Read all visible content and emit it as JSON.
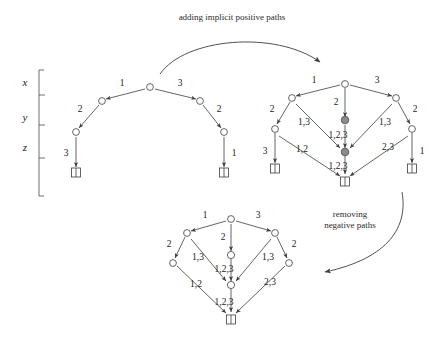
{
  "figure": {
    "title_visible": false,
    "width": 429,
    "height": 346,
    "background": "#ffffff",
    "ink_color": "#3d3d3d",
    "filled_node_color": "#8c8c8c",
    "open_node_color": "#ffffff"
  },
  "captions": {
    "top": "adding implicit positive paths",
    "right_line1": "removing",
    "right_line2": "negative paths"
  },
  "axis": {
    "labels": [
      "x",
      "y",
      "z"
    ],
    "bracket_note": "vertical level bracket with three level labels"
  },
  "diagrams": [
    {
      "id": "left",
      "name": "original-graph",
      "description": "initial partial order diagram with explicit edges only",
      "nodes": [
        {
          "id": "top",
          "kind": "open"
        },
        {
          "id": "upper-left",
          "kind": "open"
        },
        {
          "id": "upper-right",
          "kind": "open"
        },
        {
          "id": "mid-left",
          "kind": "open"
        },
        {
          "id": "mid-right",
          "kind": "open"
        },
        {
          "id": "bottom-left-terminal",
          "kind": "terminal"
        },
        {
          "id": "bottom-right-terminal",
          "kind": "terminal"
        }
      ],
      "edge_labels": [
        {
          "id": "l-top-left",
          "text": "1"
        },
        {
          "id": "l-top-right",
          "text": "3"
        },
        {
          "id": "l-left-down",
          "text": "2"
        },
        {
          "id": "l-right-down",
          "text": "2"
        },
        {
          "id": "l-left-bottom",
          "text": "3"
        },
        {
          "id": "l-right-bottom",
          "text": "1"
        }
      ]
    },
    {
      "id": "right",
      "name": "graph-with-implicit-positive-paths",
      "description": "same graph after adding implicit positive paths; central chain nodes are filled",
      "nodes": [
        {
          "id": "top",
          "kind": "open"
        },
        {
          "id": "upper-left",
          "kind": "open"
        },
        {
          "id": "upper-right",
          "kind": "open"
        },
        {
          "id": "mid-left",
          "kind": "open"
        },
        {
          "id": "mid-right",
          "kind": "open"
        },
        {
          "id": "center-upper",
          "kind": "filled"
        },
        {
          "id": "center-lower",
          "kind": "filled"
        },
        {
          "id": "bottom-left-terminal",
          "kind": "terminal"
        },
        {
          "id": "bottom-right-terminal",
          "kind": "terminal"
        },
        {
          "id": "bottom-center-terminal",
          "kind": "terminal"
        }
      ],
      "edge_labels": [
        {
          "id": "r-top-left",
          "text": "1"
        },
        {
          "id": "r-top-right",
          "text": "3"
        },
        {
          "id": "r-top-center",
          "text": "2"
        },
        {
          "id": "r-left-down",
          "text": "2"
        },
        {
          "id": "r-right-down",
          "text": "2"
        },
        {
          "id": "r-left-diag",
          "text": "1,3"
        },
        {
          "id": "r-right-diag",
          "text": "1,3"
        },
        {
          "id": "r-center-mid",
          "text": "1,2,3"
        },
        {
          "id": "r-left-low-diag",
          "text": "1,2"
        },
        {
          "id": "r-right-low-diag",
          "text": "2,3"
        },
        {
          "id": "r-center-bottom",
          "text": "1,2,3"
        },
        {
          "id": "r-left-bottom",
          "text": "3"
        },
        {
          "id": "r-right-bottom",
          "text": "1"
        }
      ]
    },
    {
      "id": "bottom",
      "name": "graph-after-removing-negative-paths",
      "description": "final graph after removing negative paths; central chain nodes are open and side terminals are gone",
      "nodes": [
        {
          "id": "top",
          "kind": "open"
        },
        {
          "id": "upper-left",
          "kind": "open"
        },
        {
          "id": "upper-right",
          "kind": "open"
        },
        {
          "id": "mid-left",
          "kind": "open"
        },
        {
          "id": "mid-right",
          "kind": "open"
        },
        {
          "id": "center-upper",
          "kind": "open"
        },
        {
          "id": "center-lower",
          "kind": "open"
        },
        {
          "id": "bottom-center-terminal",
          "kind": "terminal"
        }
      ],
      "edge_labels": [
        {
          "id": "b-top-left",
          "text": "1"
        },
        {
          "id": "b-top-right",
          "text": "3"
        },
        {
          "id": "b-top-center",
          "text": "2"
        },
        {
          "id": "b-left-down",
          "text": "2"
        },
        {
          "id": "b-right-down",
          "text": "2"
        },
        {
          "id": "b-left-diag",
          "text": "1,3"
        },
        {
          "id": "b-right-diag",
          "text": "1,3"
        },
        {
          "id": "b-center-mid",
          "text": "1,2,3"
        },
        {
          "id": "b-left-low-diag",
          "text": "1,2"
        },
        {
          "id": "b-right-low-diag",
          "text": "2,3"
        },
        {
          "id": "b-center-bottom",
          "text": "1,2,3"
        }
      ]
    }
  ]
}
